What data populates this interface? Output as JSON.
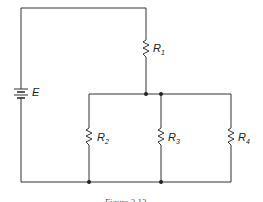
{
  "diagram": {
    "type": "circuit",
    "source": {
      "label": "E"
    },
    "resistors": [
      {
        "id": "R1",
        "letter": "R",
        "sub": "1"
      },
      {
        "id": "R2",
        "letter": "R",
        "sub": "2"
      },
      {
        "id": "R3",
        "letter": "R",
        "sub": "3"
      },
      {
        "id": "R4",
        "letter": "R",
        "sub": "4"
      }
    ],
    "caption": "Figure 3.13"
  }
}
